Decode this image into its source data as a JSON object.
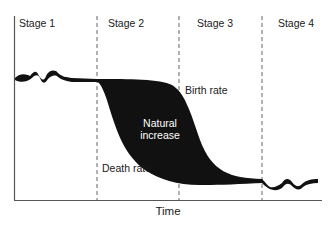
{
  "stages": [
    {
      "label": "Stage 1"
    },
    {
      "label": "Stage 2"
    },
    {
      "label": "Stage 3"
    },
    {
      "label": "Stage 4"
    }
  ],
  "annotations": {
    "birth_rate": "Birth rate",
    "natural_increase_line1": "Natural",
    "natural_increase_line2": "increase",
    "death_rate": "Death rate"
  },
  "axes": {
    "xlabel": "Time"
  },
  "colors": {
    "fill": "#111111",
    "axis": "#444444",
    "text_on_fill": "#ffffff"
  }
}
